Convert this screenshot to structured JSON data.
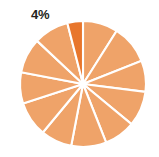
{
  "chart_data": {
    "type": "pie",
    "title": "",
    "subtitle": "",
    "xlabel": "",
    "ylabel": "",
    "grid": false,
    "legend_position": "none",
    "center": {
      "x": 83,
      "y": 84
    },
    "radius": 63,
    "start_angle_deg": -90,
    "direction": "clockwise",
    "slice_stroke_color": "#FFFFFF",
    "slice_stroke_width": 2.1,
    "background_color": "#FFFFFF",
    "default_slice_color": "#EFA369",
    "highlight_slice_color": "#E8762C",
    "categories": [
      "Segment 1",
      "Segment 2",
      "Segment 3",
      "Segment 4",
      "Segment 5",
      "Segment 6",
      "Segment 7",
      "Segment 8",
      "Segment 9",
      "Segment 10",
      "Segment 11",
      "Segment 12"
    ],
    "values": [
      9,
      10,
      8,
      9,
      8,
      9,
      8,
      9,
      8,
      9,
      9,
      4
    ],
    "slices": [
      {
        "label": "Segment 1",
        "value": 9,
        "color": "#EFA369",
        "highlighted": false,
        "start_deg": -90,
        "end_deg": -57.6
      },
      {
        "label": "Segment 2",
        "value": 10,
        "color": "#EFA369",
        "highlighted": false,
        "start_deg": -57.6,
        "end_deg": -21.6
      },
      {
        "label": "Segment 3",
        "value": 8,
        "color": "#EFA369",
        "highlighted": false,
        "start_deg": -21.6,
        "end_deg": 7.2
      },
      {
        "label": "Segment 4",
        "value": 9,
        "color": "#EFA369",
        "highlighted": false,
        "start_deg": 7.2,
        "end_deg": 39.6
      },
      {
        "label": "Segment 5",
        "value": 8,
        "color": "#EFA369",
        "highlighted": false,
        "start_deg": 39.6,
        "end_deg": 68.4
      },
      {
        "label": "Segment 6",
        "value": 9,
        "color": "#EFA369",
        "highlighted": false,
        "start_deg": 68.4,
        "end_deg": 100.8
      },
      {
        "label": "Segment 7",
        "value": 8,
        "color": "#EFA369",
        "highlighted": false,
        "start_deg": 100.8,
        "end_deg": 129.6
      },
      {
        "label": "Segment 8",
        "value": 9,
        "color": "#EFA369",
        "highlighted": false,
        "start_deg": 129.6,
        "end_deg": 162.0
      },
      {
        "label": "Segment 9",
        "value": 8,
        "color": "#EFA369",
        "highlighted": false,
        "start_deg": 162.0,
        "end_deg": 190.8
      },
      {
        "label": "Segment 10",
        "value": 9,
        "color": "#EFA369",
        "highlighted": false,
        "start_deg": 190.8,
        "end_deg": 223.2
      },
      {
        "label": "Segment 11",
        "value": 9,
        "color": "#EFA369",
        "highlighted": false,
        "start_deg": 223.2,
        "end_deg": 255.6
      },
      {
        "label": "Segment 12",
        "value": 4,
        "color": "#E8762C",
        "highlighted": true,
        "start_deg": 255.6,
        "end_deg": 270.0
      }
    ],
    "annotations": [
      {
        "name": "highlight-percent-label",
        "text": "4%",
        "color": "#231F20",
        "x": 31,
        "y": 8,
        "refers_to_slice": "Segment 12"
      }
    ]
  }
}
